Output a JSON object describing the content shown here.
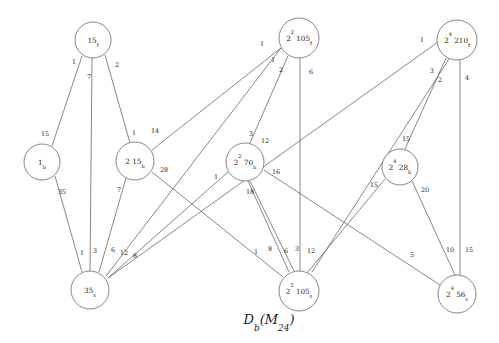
{
  "figure": {
    "caption_main": "D",
    "caption_sub1": "b",
    "caption_paren_open": "(",
    "caption_m": "M",
    "caption_sub2": "24",
    "caption_paren_close": ")",
    "caption_full": "D_b(M_24)",
    "background_color": "#ffffff",
    "line_color": "#555555",
    "text_color": "#1a1a1a"
  },
  "chart_data": {
    "type": "diagram",
    "nodes": [
      {
        "id": "n15f",
        "base": "15",
        "sup": "",
        "sub": "f",
        "cx": 93,
        "cy": 40,
        "r": 18
      },
      {
        "id": "n105f",
        "base": "105",
        "sup": "2",
        "sub": "f",
        "cx": 299,
        "cy": 38,
        "r": 20
      },
      {
        "id": "n210f",
        "base": "210",
        "sup": "4",
        "sub": "f",
        "cx": 457,
        "cy": 40,
        "r": 20
      },
      {
        "id": "n1b",
        "base": "1",
        "sup": "",
        "sub": "b",
        "cx": 42,
        "cy": 162,
        "r": 18
      },
      {
        "id": "n215b",
        "base": "15",
        "sup": "",
        "sub": "b",
        "prefix": "2 ",
        "cx": 135,
        "cy": 161,
        "r": 19
      },
      {
        "id": "n70b",
        "base": "70",
        "sup": "2",
        "sub": "b",
        "cx": 245,
        "cy": 162,
        "r": 19
      },
      {
        "id": "n28b",
        "base": "28",
        "sup": "4",
        "sub": "b",
        "cx": 400,
        "cy": 167,
        "r": 18
      },
      {
        "id": "n35s",
        "base": "35",
        "sup": "",
        "sub": "s",
        "cx": 90,
        "cy": 290,
        "r": 19
      },
      {
        "id": "n105s",
        "base": "105",
        "sup": "3",
        "sub": "s",
        "cx": 299,
        "cy": 291,
        "r": 20
      },
      {
        "id": "n56s",
        "base": "56",
        "sup": "4",
        "sub": "s",
        "cx": 457,
        "cy": 294,
        "r": 19
      }
    ],
    "edges": [
      {
        "from": "n15f",
        "to": "n1b",
        "weight_near": "1",
        "weight_far": "15",
        "lx1": 74,
        "ly1": 64,
        "lx2": 46,
        "ly2": 133
      },
      {
        "from": "n15f",
        "to": "n35s",
        "weight_near": "7",
        "weight_far": "3",
        "lx1": 88,
        "ly1": 77,
        "lx2": 83,
        "ly2": 251
      },
      {
        "from": "n15f",
        "to": "n215b",
        "weight_near": "2",
        "weight_far": "1",
        "lx1": 116,
        "ly1": 65,
        "lx2": 135,
        "ly2": 133
      },
      {
        "from": "n1b",
        "to": "n35s",
        "weight_near": "35",
        "weight_far": "1",
        "lx1": 62,
        "ly1": 188,
        "lx2": 80,
        "ly2": 252
      },
      {
        "from": "n215b",
        "to": "n35s",
        "weight_near": "7",
        "weight_far": "6",
        "lx1": 119,
        "ly1": 190,
        "lx2": 113,
        "ly2": 251
      },
      {
        "from": "n215b",
        "to": "n105s",
        "weight_near": "28",
        "weight_far": "12",
        "lx1": 163,
        "ly1": 167,
        "lx2": 234,
        "ly2": 252
      },
      {
        "from": "n215b",
        "to": "n105f",
        "weight_near": "14",
        "weight_far": "",
        "lx1": 155,
        "ly1": 132,
        "lx2": 0,
        "ly2": 0
      },
      {
        "from": "n105f",
        "to": "n35s",
        "weight_near": "1",
        "weight_far": "12",
        "lx1": 262,
        "ly1": 45,
        "lx2": 124,
        "ly2": 248
      },
      {
        "from": "n105f",
        "to": "n70b",
        "weight_near": "2",
        "weight_far": "3",
        "lx1": 280,
        "ly1": 70,
        "lx2": 251,
        "ly2": 133
      },
      {
        "from": "n105f",
        "to": "n105s",
        "weight_near": "6",
        "weight_far": "3",
        "lx1": 310,
        "ly1": 73,
        "lx2": 291,
        "ly2": 251
      },
      {
        "from": "n105f",
        "to": "n215b",
        "weight_near": "1",
        "weight_far": "",
        "lx1": 272,
        "ly1": 60,
        "lx2": 0,
        "ly2": 0
      },
      {
        "from": "n210f",
        "to": "n35s",
        "weight_near": "1",
        "weight_far": "8",
        "lx1": 422,
        "ly1": 40,
        "lx2": 130,
        "ly2": 256
      },
      {
        "from": "n210f",
        "to": "n28b",
        "weight_near": "3",
        "weight_far": "15",
        "lx1": 433,
        "ly1": 70,
        "lx2": 405,
        "ly2": 137
      },
      {
        "from": "n210f",
        "to": "n105s",
        "weight_near": "2",
        "weight_far": "12",
        "lx1": 441,
        "ly1": 79,
        "lx2": 310,
        "ly2": 252
      },
      {
        "from": "n210f",
        "to": "n56s",
        "weight_near": "4",
        "weight_far": "15",
        "lx1": 468,
        "ly1": 78,
        "lx2": 468,
        "ly2": 251
      },
      {
        "from": "n70b",
        "to": "n105s",
        "weight_near": "18",
        "weight_far": "6",
        "lx1": 249,
        "ly1": 190,
        "lx2": 286,
        "ly2": 251
      },
      {
        "from": "n70b",
        "to": "n56s",
        "weight_near": "16",
        "weight_far": "5",
        "lx1": 275,
        "ly1": 172,
        "lx2": 412,
        "ly2": 254
      },
      {
        "from": "n70b",
        "to": "n35s",
        "weight_near": "1",
        "weight_far": "",
        "lx1": 216,
        "ly1": 176,
        "lx2": 0,
        "ly2": 0
      },
      {
        "from": "n28b",
        "to": "n56s",
        "weight_near": "20",
        "weight_far": "10",
        "lx1": 425,
        "ly1": 188,
        "lx2": 449,
        "ly2": 251
      },
      {
        "from": "n28b",
        "to": "n105s",
        "weight_near": "15",
        "weight_far": "8",
        "lx1": 374,
        "ly1": 185,
        "lx2": 270,
        "ly2": 248
      },
      {
        "from": "n105s",
        "to": "n70b",
        "weight_near": "1",
        "weight_far": "",
        "lx1": 256,
        "ly1": 251,
        "lx2": 0,
        "ly2": 0
      }
    ],
    "edge_label_values": [
      "1",
      "15",
      "7",
      "3",
      "2",
      "1",
      "35",
      "1",
      "7",
      "6",
      "28",
      "12",
      "14",
      "1",
      "2",
      "3",
      "6",
      "3",
      "1",
      "1",
      "8",
      "3",
      "15",
      "2",
      "12",
      "4",
      "15",
      "18",
      "6",
      "16",
      "5",
      "1",
      "20",
      "10",
      "15",
      "8",
      "12",
      "1"
    ]
  },
  "edge_labels": [
    {
      "text": "1",
      "x": 74,
      "y": 62
    },
    {
      "text": "7",
      "x": 89,
      "y": 77
    },
    {
      "text": "2",
      "x": 117,
      "y": 65
    },
    {
      "text": "15",
      "x": 45,
      "y": 134
    },
    {
      "text": "1",
      "x": 134,
      "y": 133
    },
    {
      "text": "14",
      "x": 155,
      "y": 131
    },
    {
      "text": "35",
      "x": 62,
      "y": 192
    },
    {
      "text": "7",
      "x": 119,
      "y": 190
    },
    {
      "text": "28",
      "x": 164,
      "y": 170
    },
    {
      "text": "1",
      "x": 82,
      "y": 253
    },
    {
      "text": "3",
      "x": 95,
      "y": 251
    },
    {
      "text": "6",
      "x": 113,
      "y": 250
    },
    {
      "text": "12",
      "x": 124,
      "y": 253
    },
    {
      "text": "8",
      "x": 135,
      "y": 256
    },
    {
      "text": "1",
      "x": 262,
      "y": 44
    },
    {
      "text": "1",
      "x": 273,
      "y": 60
    },
    {
      "text": "2",
      "x": 281,
      "y": 70
    },
    {
      "text": "6",
      "x": 311,
      "y": 72
    },
    {
      "text": "3",
      "x": 251,
      "y": 134
    },
    {
      "text": "12",
      "x": 265,
      "y": 141
    },
    {
      "text": "1",
      "x": 422,
      "y": 40
    },
    {
      "text": "3",
      "x": 432,
      "y": 71
    },
    {
      "text": "2",
      "x": 440,
      "y": 80
    },
    {
      "text": "4",
      "x": 467,
      "y": 78
    },
    {
      "text": "15",
      "x": 406,
      "y": 139
    },
    {
      "text": "16",
      "x": 276,
      "y": 172
    },
    {
      "text": "18",
      "x": 250,
      "y": 192
    },
    {
      "text": "1",
      "x": 216,
      "y": 177
    },
    {
      "text": "15",
      "x": 374,
      "y": 185
    },
    {
      "text": "20",
      "x": 425,
      "y": 190
    },
    {
      "text": "1",
      "x": 256,
      "y": 252
    },
    {
      "text": "6",
      "x": 286,
      "y": 251
    },
    {
      "text": "3",
      "x": 297,
      "y": 249
    },
    {
      "text": "12",
      "x": 311,
      "y": 251
    },
    {
      "text": "8",
      "x": 270,
      "y": 249
    },
    {
      "text": "5",
      "x": 412,
      "y": 255
    },
    {
      "text": "10",
      "x": 450,
      "y": 250
    },
    {
      "text": "15",
      "x": 469,
      "y": 250
    }
  ]
}
